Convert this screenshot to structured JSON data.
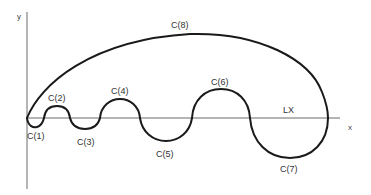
{
  "diagram": {
    "type": "curve-decomposition",
    "axes": {
      "x_label": "x",
      "y_label": "y",
      "line_label": "LX"
    },
    "segments": [
      {
        "id": "C1",
        "label": "C(1)",
        "position": "below"
      },
      {
        "id": "C2",
        "label": "C(2)",
        "position": "above"
      },
      {
        "id": "C3",
        "label": "C(3)",
        "position": "below"
      },
      {
        "id": "C4",
        "label": "C(4)",
        "position": "above"
      },
      {
        "id": "C5",
        "label": "C(5)",
        "position": "below"
      },
      {
        "id": "C6",
        "label": "C(6)",
        "position": "above"
      },
      {
        "id": "C7",
        "label": "C(7)",
        "position": "below"
      },
      {
        "id": "C8",
        "label": "C(8)",
        "position": "above"
      }
    ],
    "colors": {
      "curve": "#1a1a1a",
      "axis": "#6a6a6a",
      "text": "#333333",
      "background": "#ffffff"
    }
  }
}
